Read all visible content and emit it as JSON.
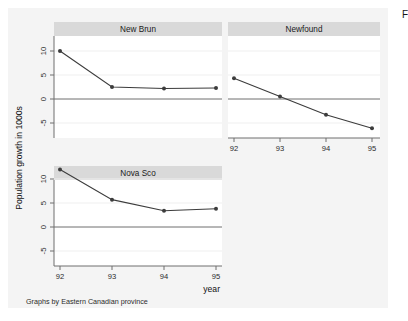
{
  "figure": {
    "y_axis_title": "Population growth in 1000s",
    "x_axis_title": "year",
    "note": "Graphs by Eastern Canadian province",
    "corner_fragment": "F",
    "background_color": "#f4f4f4",
    "panel_background_color": "#ffffff",
    "title_bar_color": "#d9d9d9",
    "line_color": "#3c3c3c",
    "marker_color": "#3c3c3c",
    "gridline_color": "#efefef",
    "zero_line_color": "#6e6e6e",
    "axis_color": "#6e6e6e"
  },
  "chart_data": {
    "type": "line",
    "title": "",
    "xlabel": "year",
    "ylabel": "Population growth in 1000s",
    "x": [
      92,
      93,
      94,
      95
    ],
    "xtick_labels": [
      "92",
      "93",
      "94",
      "95"
    ],
    "ytick_values": [
      10,
      5,
      0,
      -5
    ],
    "ytick_labels": [
      "10",
      "5",
      "0",
      "-5"
    ],
    "ylim": [
      -8,
      13.5
    ],
    "xlim": [
      91.6,
      95.4
    ],
    "grid": true,
    "legend": "none",
    "panel_layout": "2x2 small multiples, bottom-right empty",
    "note": "Graphs by Eastern Canadian province",
    "panels": [
      {
        "name": "New Brun",
        "position": "top-left",
        "values": [
          10.0,
          2.5,
          2.2,
          2.3
        ]
      },
      {
        "name": "Newfound",
        "position": "top-right",
        "values": [
          4.3,
          0.5,
          -3.3,
          -6.1
        ]
      },
      {
        "name": "Nova Sco",
        "position": "bottom-left",
        "values": [
          12.0,
          5.7,
          3.4,
          3.8
        ]
      }
    ]
  }
}
